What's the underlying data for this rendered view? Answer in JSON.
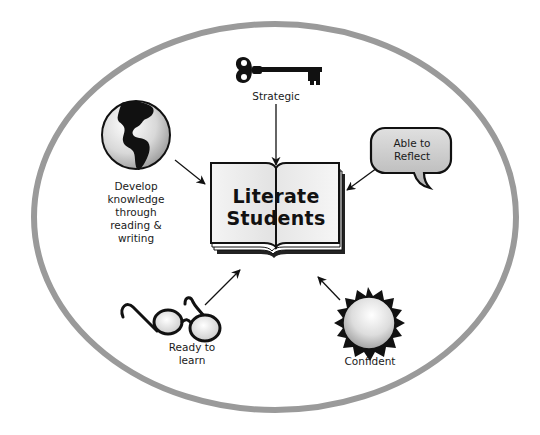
{
  "diagram": {
    "center": {
      "lines": [
        "Literate",
        "Students"
      ],
      "icon": "open-book-icon"
    },
    "nodes": [
      {
        "id": "strategic",
        "lines": [
          "Strategic"
        ],
        "icon": "key-icon"
      },
      {
        "id": "develop-knowledge",
        "lines": [
          "Develop",
          "knowledge",
          "through",
          "reading &",
          "writing"
        ],
        "icon": "globe-icon"
      },
      {
        "id": "able-to-reflect",
        "lines": [
          "Able to",
          "Reflect"
        ],
        "icon": "speech-bubble-icon"
      },
      {
        "id": "ready-to-learn",
        "lines": [
          "Ready to",
          "learn"
        ],
        "icon": "glasses-icon"
      },
      {
        "id": "confident",
        "lines": [
          "Confident"
        ],
        "icon": "sun-icon"
      }
    ],
    "colors": {
      "ellipse_border": "#999999",
      "ink": "#111111",
      "fill_light": "#eeeeee",
      "fill_mid": "#bbbbbb"
    }
  }
}
